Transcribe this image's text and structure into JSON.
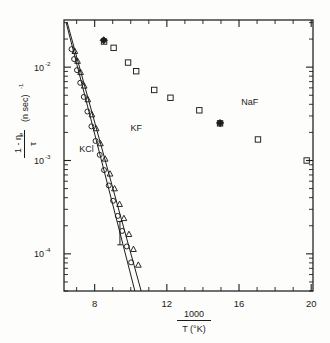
{
  "figure": {
    "background_color": "#fdfdfb",
    "ink_color": "#1d1d1d"
  },
  "axes": {
    "x": {
      "title_numerator": "1000",
      "title_denominator": "T (°K)",
      "scale": "linear",
      "min": 6.3,
      "max": 20.1,
      "ticks": [
        8,
        12,
        16,
        20
      ],
      "tick_labels": [
        "8",
        "12",
        "16",
        "20"
      ],
      "minor_tick_step": 1
    },
    "y": {
      "title_numerator": "1 - η",
      "title_numerator_sub": "e",
      "title_denominator": "τ",
      "title_units": "(n sec)",
      "title_units_exp": "-1",
      "scale": "log",
      "min": 4e-05,
      "max": 0.032,
      "decade_labels": [
        {
          "mantissa": "10",
          "exponent": "-2",
          "value": 0.01
        },
        {
          "mantissa": "10",
          "exponent": "-3",
          "value": 0.001
        },
        {
          "mantissa": "10",
          "exponent": "-4",
          "value": 0.0001
        }
      ]
    }
  },
  "annotations": [
    {
      "name": "label-kf",
      "text": "KF",
      "x": 10.3,
      "y": 0.00205
    },
    {
      "name": "label-kcl",
      "text": "KCl",
      "x": 7.55,
      "y": 0.00122
    },
    {
      "name": "label-naf",
      "text": "NaF",
      "x": 16.6,
      "y": 0.0039
    }
  ],
  "chart_data": {
    "type": "scatter",
    "title": "",
    "xlabel": "1000 / T (°K)",
    "ylabel": "(1 - ηe) / τ  (n sec)^-1",
    "xlim": [
      6.3,
      20.1
    ],
    "ylim": [
      4e-05,
      0.032
    ],
    "xscale": "linear",
    "yscale": "log",
    "grid": false,
    "legend": "inline-annotations",
    "series": [
      {
        "name": "NaF",
        "marker": "open-square",
        "has_fit_line": false,
        "points": [
          {
            "x": 8.52,
            "y": 0.0188
          },
          {
            "x": 9.05,
            "y": 0.0161
          },
          {
            "x": 9.85,
            "y": 0.0112
          },
          {
            "x": 10.3,
            "y": 0.00905
          },
          {
            "x": 11.3,
            "y": 0.0057
          },
          {
            "x": 12.2,
            "y": 0.0047
          },
          {
            "x": 13.8,
            "y": 0.00345
          },
          {
            "x": 14.95,
            "y": 0.0025
          },
          {
            "x": 17.05,
            "y": 0.00168
          },
          {
            "x": 19.75,
            "y": 0.001
          }
        ]
      },
      {
        "name": "NaF-special",
        "marker": "solid-diamond",
        "has_fit_line": false,
        "points": [
          {
            "x": 8.5,
            "y": 0.0194
          },
          {
            "x": 14.95,
            "y": 0.00252
          }
        ]
      },
      {
        "name": "KF",
        "marker": "open-triangle",
        "has_fit_line": true,
        "fit_line": {
          "x1": 6.48,
          "y1": 0.03,
          "x2": 10.6,
          "y2": 3.85e-05
        },
        "points": [
          {
            "x": 6.9,
            "y": 0.0148
          },
          {
            "x": 7.05,
            "y": 0.0116
          },
          {
            "x": 7.22,
            "y": 0.0088
          },
          {
            "x": 7.42,
            "y": 0.0063
          },
          {
            "x": 7.62,
            "y": 0.0045
          },
          {
            "x": 7.85,
            "y": 0.0031
          },
          {
            "x": 8.08,
            "y": 0.0022
          },
          {
            "x": 8.32,
            "y": 0.00152
          },
          {
            "x": 8.58,
            "y": 0.00104
          },
          {
            "x": 8.85,
            "y": 0.00072
          },
          {
            "x": 9.1,
            "y": 0.0005
          },
          {
            "x": 9.38,
            "y": 0.00034
          },
          {
            "x": 9.62,
            "y": 0.00024
          },
          {
            "x": 9.9,
            "y": 0.000162
          },
          {
            "x": 10.15,
            "y": 0.000112
          },
          {
            "x": 10.42,
            "y": 7.6e-05
          }
        ]
      },
      {
        "name": "KCl",
        "marker": "open-circle",
        "has_fit_line": true,
        "fit_line": {
          "x1": 6.42,
          "y1": 0.03,
          "x2": 10.25,
          "y2": 3.85e-05
        },
        "points": [
          {
            "x": 6.72,
            "y": 0.0156
          },
          {
            "x": 6.86,
            "y": 0.0122
          },
          {
            "x": 7.02,
            "y": 0.0093
          },
          {
            "x": 7.2,
            "y": 0.0068
          },
          {
            "x": 7.4,
            "y": 0.0048
          },
          {
            "x": 7.6,
            "y": 0.00335
          },
          {
            "x": 7.82,
            "y": 0.00232
          },
          {
            "x": 8.05,
            "y": 0.00162
          },
          {
            "x": 8.28,
            "y": 0.00115
          },
          {
            "x": 8.52,
            "y": 0.00079
          },
          {
            "x": 8.78,
            "y": 0.00054
          },
          {
            "x": 9.02,
            "y": 0.00037
          },
          {
            "x": 9.28,
            "y": 0.000255
          },
          {
            "x": 9.52,
            "y": 0.000176
          },
          {
            "x": 9.78,
            "y": 0.00012
          },
          {
            "x": 10.02,
            "y": 8.1e-05
          }
        ]
      }
    ],
    "error_bars": [
      {
        "x": 9.4,
        "y": 0.000165,
        "y_low": 0.000125,
        "y_high": 0.000222
      }
    ]
  }
}
